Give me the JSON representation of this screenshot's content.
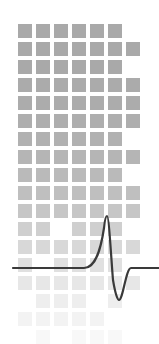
{
  "illustration": {
    "description": "Grid of gray squares fading downward with an action-potential waveform overlay",
    "colors": {
      "background": "#ffffff",
      "square": "#a9a9a9",
      "waveform": "#3a3a3a"
    },
    "grid": {
      "origin_x": 18,
      "origin_y": 24,
      "cell_size": 14,
      "pitch": 18,
      "rows": [
        {
          "opacity": 1.0,
          "cells": [
            1,
            1,
            1,
            1,
            1,
            1,
            0
          ]
        },
        {
          "opacity": 1.0,
          "cells": [
            1,
            1,
            1,
            1,
            1,
            1,
            1
          ]
        },
        {
          "opacity": 1.0,
          "cells": [
            1,
            1,
            1,
            1,
            1,
            1,
            0
          ]
        },
        {
          "opacity": 0.98,
          "cells": [
            1,
            1,
            1,
            1,
            1,
            1,
            1
          ]
        },
        {
          "opacity": 0.96,
          "cells": [
            1,
            1,
            1,
            1,
            1,
            1,
            1
          ]
        },
        {
          "opacity": 0.94,
          "cells": [
            1,
            1,
            1,
            1,
            1,
            1,
            1
          ]
        },
        {
          "opacity": 0.9,
          "cells": [
            1,
            1,
            1,
            1,
            1,
            1,
            0
          ]
        },
        {
          "opacity": 0.86,
          "cells": [
            1,
            1,
            1,
            1,
            1,
            1,
            1
          ]
        },
        {
          "opacity": 0.8,
          "cells": [
            1,
            1,
            1,
            1,
            1,
            1,
            0
          ]
        },
        {
          "opacity": 0.74,
          "cells": [
            1,
            1,
            1,
            1,
            1,
            1,
            1
          ]
        },
        {
          "opacity": 0.66,
          "cells": [
            1,
            1,
            1,
            1,
            1,
            1,
            1
          ]
        },
        {
          "opacity": 0.56,
          "cells": [
            1,
            1,
            0,
            1,
            1,
            1,
            0
          ]
        },
        {
          "opacity": 0.46,
          "cells": [
            1,
            1,
            1,
            1,
            1,
            1,
            1
          ]
        },
        {
          "opacity": 0.36,
          "cells": [
            1,
            0,
            1,
            1,
            1,
            1,
            0
          ]
        },
        {
          "opacity": 0.28,
          "cells": [
            1,
            1,
            1,
            1,
            1,
            1,
            1
          ]
        },
        {
          "opacity": 0.2,
          "cells": [
            0,
            1,
            1,
            1,
            0,
            1,
            0
          ]
        },
        {
          "opacity": 0.14,
          "cells": [
            1,
            1,
            1,
            1,
            1,
            0,
            0
          ]
        },
        {
          "opacity": 0.08,
          "cells": [
            0,
            1,
            0,
            1,
            1,
            1,
            0
          ]
        }
      ]
    },
    "waveform": {
      "type": "action-potential",
      "stroke_width": 2.2,
      "baseline_y": 268,
      "start_x": 13,
      "rise_start_x": 84,
      "peak": {
        "x": 107,
        "y": 216
      },
      "trough": {
        "x": 119,
        "y": 300
      },
      "return_x": 131,
      "end_x": 159
    }
  }
}
